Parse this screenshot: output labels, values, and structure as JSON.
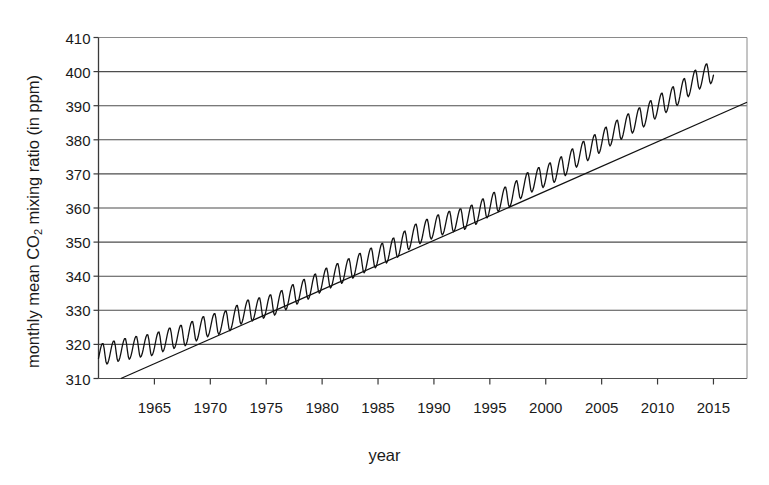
{
  "chart_data": {
    "type": "line",
    "title": "",
    "xlabel": "year",
    "ylabel_parts": {
      "before": "monthly mean CO",
      "subscript": "2",
      "after": " mixing ratio (in ppm)"
    },
    "ylabel": "monthly mean CO2 mixing ratio (in ppm)",
    "xlim": [
      1960,
      2018
    ],
    "ylim": [
      310,
      410
    ],
    "xticks": [
      1965,
      1970,
      1975,
      1980,
      1985,
      1990,
      1995,
      2000,
      2005,
      2010,
      2015
    ],
    "xtick_labels": [
      "1965",
      "1970",
      "1975",
      "1980",
      "1985",
      "1990",
      "1995",
      "2000",
      "2005",
      "2010",
      "2015"
    ],
    "yticks": [
      310,
      320,
      330,
      340,
      350,
      360,
      370,
      380,
      390,
      400,
      410
    ],
    "ytick_labels": [
      "310",
      "320",
      "330",
      "340",
      "350",
      "360",
      "370",
      "380",
      "390",
      "400",
      "410"
    ],
    "grid": "horizontal",
    "legend": "none",
    "line_color": "#111111",
    "grid_color": "#4d4d4d",
    "axis_color": "#4d4d4d",
    "background": "#ffffff",
    "series": [
      {
        "name": "monthly mean CO2 (Mauna Loa)",
        "description": "monthly mean CO2 mixing ratio with seasonal sawtooth oscillation superimposed on rising trend",
        "x_start": 1960.0,
        "x_end": 2015.0,
        "samples_per_year": 12,
        "seasonal_amplitude_ppm": 3.2,
        "annual_means": [
          {
            "year": 1960,
            "value": 316.9
          },
          {
            "year": 1961,
            "value": 317.6
          },
          {
            "year": 1962,
            "value": 318.4
          },
          {
            "year": 1963,
            "value": 319.0
          },
          {
            "year": 1964,
            "value": 319.6
          },
          {
            "year": 1965,
            "value": 320.0
          },
          {
            "year": 1966,
            "value": 321.4
          },
          {
            "year": 1967,
            "value": 322.2
          },
          {
            "year": 1968,
            "value": 323.0
          },
          {
            "year": 1969,
            "value": 324.6
          },
          {
            "year": 1970,
            "value": 325.7
          },
          {
            "year": 1971,
            "value": 326.3
          },
          {
            "year": 1972,
            "value": 327.5
          },
          {
            "year": 1973,
            "value": 329.7
          },
          {
            "year": 1974,
            "value": 330.2
          },
          {
            "year": 1975,
            "value": 331.1
          },
          {
            "year": 1976,
            "value": 332.0
          },
          {
            "year": 1977,
            "value": 333.8
          },
          {
            "year": 1978,
            "value": 335.4
          },
          {
            "year": 1979,
            "value": 336.8
          },
          {
            "year": 1980,
            "value": 338.7
          },
          {
            "year": 1981,
            "value": 340.1
          },
          {
            "year": 1982,
            "value": 341.4
          },
          {
            "year": 1983,
            "value": 343.0
          },
          {
            "year": 1984,
            "value": 344.6
          },
          {
            "year": 1985,
            "value": 346.0
          },
          {
            "year": 1986,
            "value": 347.4
          },
          {
            "year": 1987,
            "value": 349.2
          },
          {
            "year": 1988,
            "value": 351.6
          },
          {
            "year": 1989,
            "value": 353.1
          },
          {
            "year": 1990,
            "value": 354.4
          },
          {
            "year": 1991,
            "value": 355.6
          },
          {
            "year": 1992,
            "value": 356.4
          },
          {
            "year": 1993,
            "value": 357.1
          },
          {
            "year": 1994,
            "value": 358.8
          },
          {
            "year": 1995,
            "value": 360.8
          },
          {
            "year": 1996,
            "value": 362.6
          },
          {
            "year": 1997,
            "value": 363.8
          },
          {
            "year": 1998,
            "value": 366.6
          },
          {
            "year": 1999,
            "value": 368.3
          },
          {
            "year": 2000,
            "value": 369.5
          },
          {
            "year": 2001,
            "value": 371.1
          },
          {
            "year": 2002,
            "value": 373.2
          },
          {
            "year": 2003,
            "value": 375.8
          },
          {
            "year": 2004,
            "value": 377.5
          },
          {
            "year": 2005,
            "value": 379.8
          },
          {
            "year": 2006,
            "value": 381.9
          },
          {
            "year": 2007,
            "value": 383.8
          },
          {
            "year": 2008,
            "value": 385.6
          },
          {
            "year": 2009,
            "value": 387.4
          },
          {
            "year": 2010,
            "value": 389.9
          },
          {
            "year": 2011,
            "value": 391.6
          },
          {
            "year": 2012,
            "value": 393.8
          },
          {
            "year": 2013,
            "value": 396.5
          },
          {
            "year": 2014,
            "value": 398.6
          },
          {
            "year": 2015,
            "value": 400.0
          }
        ]
      }
    ],
    "trend_line": {
      "name": "linear trend line",
      "x_start": 1962.0,
      "y_start": 310.0,
      "x_end": 2018.0,
      "y_end": 391.0
    },
    "annotations": []
  }
}
